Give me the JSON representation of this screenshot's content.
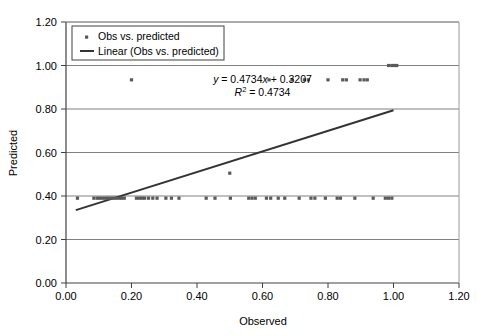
{
  "chart_data": {
    "type": "scatter",
    "title": "",
    "xlabel": "Observed",
    "ylabel": "Predicted",
    "xlim": [
      0.0,
      1.2
    ],
    "ylim": [
      0.0,
      1.2
    ],
    "xticks": [
      "0.00",
      "0.20",
      "0.40",
      "0.60",
      "0.80",
      "1.00",
      "1.20"
    ],
    "yticks": [
      "0.00",
      "0.20",
      "0.40",
      "0.60",
      "0.80",
      "1.00",
      "1.20"
    ],
    "xtick_values": [
      0.0,
      0.2,
      0.4,
      0.6,
      0.8,
      1.0,
      1.2
    ],
    "ytick_values": [
      0.0,
      0.2,
      0.4,
      0.6,
      0.8,
      1.0,
      1.2
    ],
    "grid": "horizontal",
    "legend_position": "top-left-inside",
    "legend": [
      {
        "label": "Obs vs. predicted",
        "marker": "point",
        "color": "#595959"
      },
      {
        "label": "Linear (Obs vs. predicted)",
        "marker": "line",
        "color": "#333333"
      }
    ],
    "annotations": [
      {
        "name": "regression-equation",
        "text": "y = 0.4734x + 0.3207",
        "x": 0.6,
        "y": 0.935
      },
      {
        "name": "r-squared",
        "text": "R2 = 0.4734",
        "x": 0.6,
        "y": 0.875
      }
    ],
    "equation_parts": {
      "y_symbol": "y",
      "equals": " = 0.4734",
      "x_symbol": "x",
      "intercept": " + 0.3207",
      "r_symbol": "R",
      "r_exponent": "2",
      "r_value": " = 0.4734"
    },
    "trendline": {
      "name": "Linear (Obs vs. predicted)",
      "slope": 0.4734,
      "intercept": 0.3207,
      "x_start": 0.03,
      "x_end": 1.0,
      "y_start": 0.335,
      "y_end": 0.794,
      "color": "#333333"
    },
    "series": [
      {
        "name": "Obs vs. predicted",
        "marker_color": "#595959",
        "points": [
          [
            0.035,
            0.39
          ],
          [
            0.085,
            0.39
          ],
          [
            0.095,
            0.39
          ],
          [
            0.102,
            0.39
          ],
          [
            0.11,
            0.39
          ],
          [
            0.118,
            0.39
          ],
          [
            0.125,
            0.39
          ],
          [
            0.132,
            0.39
          ],
          [
            0.14,
            0.39
          ],
          [
            0.148,
            0.39
          ],
          [
            0.155,
            0.39
          ],
          [
            0.163,
            0.39
          ],
          [
            0.17,
            0.39
          ],
          [
            0.178,
            0.39
          ],
          [
            0.2,
            0.934
          ],
          [
            0.215,
            0.39
          ],
          [
            0.224,
            0.39
          ],
          [
            0.232,
            0.39
          ],
          [
            0.24,
            0.39
          ],
          [
            0.252,
            0.39
          ],
          [
            0.265,
            0.39
          ],
          [
            0.278,
            0.39
          ],
          [
            0.305,
            0.39
          ],
          [
            0.322,
            0.39
          ],
          [
            0.345,
            0.39
          ],
          [
            0.428,
            0.39
          ],
          [
            0.455,
            0.39
          ],
          [
            0.5,
            0.505
          ],
          [
            0.502,
            0.39
          ],
          [
            0.558,
            0.39
          ],
          [
            0.568,
            0.39
          ],
          [
            0.578,
            0.39
          ],
          [
            0.612,
            0.39
          ],
          [
            0.625,
            0.39
          ],
          [
            0.648,
            0.39
          ],
          [
            0.668,
            0.39
          ],
          [
            0.712,
            0.39
          ],
          [
            0.748,
            0.39
          ],
          [
            0.76,
            0.39
          ],
          [
            0.792,
            0.39
          ],
          [
            0.828,
            0.39
          ],
          [
            0.838,
            0.39
          ],
          [
            0.882,
            0.39
          ],
          [
            0.938,
            0.39
          ],
          [
            0.975,
            0.39
          ],
          [
            0.985,
            0.39
          ],
          [
            0.995,
            0.39
          ],
          [
            0.62,
            0.934
          ],
          [
            0.69,
            0.934
          ],
          [
            0.728,
            0.934
          ],
          [
            0.74,
            0.934
          ],
          [
            0.8,
            0.934
          ],
          [
            0.845,
            0.934
          ],
          [
            0.856,
            0.934
          ],
          [
            0.898,
            0.934
          ],
          [
            0.91,
            0.934
          ],
          [
            0.92,
            0.934
          ],
          [
            0.985,
            1.0
          ],
          [
            0.995,
            1.0
          ],
          [
            1.003,
            1.0
          ],
          [
            1.01,
            1.0
          ]
        ]
      }
    ]
  },
  "axes": {
    "x_label": "Observed",
    "y_label": "Predicted"
  }
}
